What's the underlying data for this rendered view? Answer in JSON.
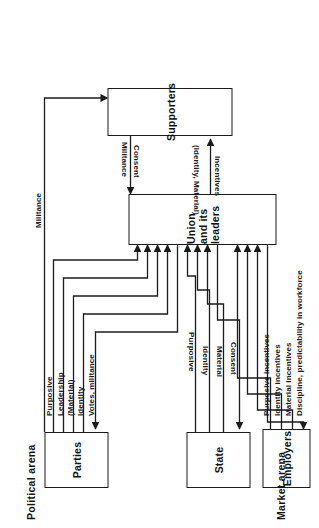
{
  "diagram": {
    "type": "flow-diagram",
    "arenas": [
      {
        "id": "political",
        "label": "Political arena"
      },
      {
        "id": "market",
        "label": "Market arena"
      }
    ],
    "nodes": [
      {
        "id": "parties",
        "label": "Parties"
      },
      {
        "id": "state",
        "label": "State"
      },
      {
        "id": "union",
        "label": "Union and its leaders"
      },
      {
        "id": "supporters",
        "label": "Supporters"
      },
      {
        "id": "employers",
        "label": "Employers"
      }
    ],
    "edge_labels": {
      "parties_votes": "Votes, militance",
      "parties_identity": "Identity",
      "parties_material": "(Material)",
      "parties_leadership": "Leadership",
      "parties_purposive": "Purposive",
      "parties_militance": "Militance",
      "state_consent": "Consent",
      "state_material": "Material",
      "state_identity": "Identity",
      "state_purposive": "Purposive",
      "supporters_consent": "Consent",
      "supporters_militance": "Militance",
      "union_incentives": "Incentives",
      "union_incentives_kinds": "(Identity, Material)",
      "employers_purposive": "Purposive incentives",
      "employers_identity": "Identity incentives",
      "employers_material": "Material incentives",
      "employers_discipline": "Discipline, predictability in workforce"
    },
    "colors": {
      "line": "#1b1b1b",
      "text": "#111111",
      "background": "#ffffff"
    }
  }
}
